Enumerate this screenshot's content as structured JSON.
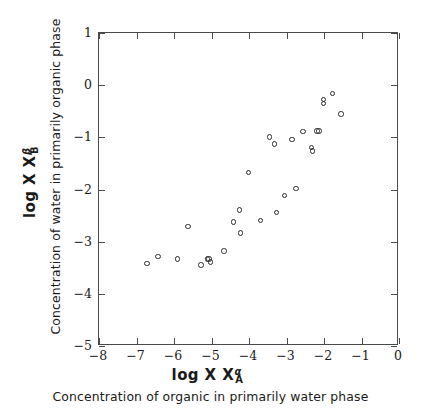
{
  "chart_data": {
    "type": "scatter",
    "title": "",
    "xlabel": "log X",
    "xlabel_sup": "α",
    "xlabel_sub": "A",
    "xlabel_caption": "Concentration of organic in primarily water phase",
    "ylabel": "log X",
    "ylabel_sup": "β",
    "ylabel_sub": "B",
    "ylabel_caption": "Concentration of water in primarily organic phase",
    "xlim": [
      -8,
      0
    ],
    "ylim": [
      -5,
      1
    ],
    "xticks": [
      -8,
      -7,
      -6,
      -5,
      -4,
      -3,
      -2,
      -1,
      0
    ],
    "yticks": [
      1,
      0,
      -1,
      -2,
      -3,
      -4,
      -5
    ],
    "xticklabels": [
      "−8",
      "−7",
      "−6",
      "−5",
      "−4",
      "−3",
      "−2",
      "−1",
      "0"
    ],
    "yticklabels": [
      "1",
      "0",
      "−1",
      "−2",
      "−3",
      "−4",
      "−5"
    ],
    "grid": false,
    "legend": null,
    "marker": "open-circle",
    "marker_color": "#2b2b2b",
    "points": [
      {
        "x": -6.72,
        "y": -3.42
      },
      {
        "x": -6.43,
        "y": -3.29
      },
      {
        "x": -5.9,
        "y": -3.33
      },
      {
        "x": -5.63,
        "y": -2.71
      },
      {
        "x": -5.28,
        "y": -3.45
      },
      {
        "x": -5.11,
        "y": -3.33
      },
      {
        "x": -5.02,
        "y": -3.39
      },
      {
        "x": -5.07,
        "y": -3.33
      },
      {
        "x": -4.67,
        "y": -3.18
      },
      {
        "x": -4.42,
        "y": -2.62
      },
      {
        "x": -4.22,
        "y": -2.83
      },
      {
        "x": -4.25,
        "y": -2.39
      },
      {
        "x": -4.02,
        "y": -1.67
      },
      {
        "x": -3.7,
        "y": -2.59
      },
      {
        "x": -3.45,
        "y": -0.99
      },
      {
        "x": -3.32,
        "y": -1.13
      },
      {
        "x": -3.26,
        "y": -2.44
      },
      {
        "x": -3.05,
        "y": -2.12
      },
      {
        "x": -2.85,
        "y": -1.04
      },
      {
        "x": -2.75,
        "y": -1.98
      },
      {
        "x": -2.56,
        "y": -0.89
      },
      {
        "x": -2.34,
        "y": -1.19
      },
      {
        "x": -2.3,
        "y": -1.26
      },
      {
        "x": -2.19,
        "y": -0.88
      },
      {
        "x": -2.13,
        "y": -0.88
      },
      {
        "x": -2.01,
        "y": -0.35
      },
      {
        "x": -2.01,
        "y": -0.27
      },
      {
        "x": -1.78,
        "y": -0.16
      },
      {
        "x": -1.55,
        "y": -0.55
      }
    ]
  }
}
